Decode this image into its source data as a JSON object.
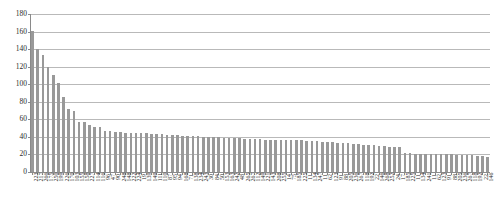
{
  "chart_data": {
    "type": "bar",
    "title": "",
    "xlabel": "",
    "ylabel": "",
    "ylim": [
      0,
      180
    ],
    "ytick_step": 20,
    "yticks": [
      180,
      160,
      140,
      120,
      100,
      80,
      60,
      40,
      20,
      0
    ],
    "grid": true,
    "legend": false,
    "bar_color": "#999999",
    "gridline_color": "#b9b9b9",
    "axis_color": "#8a8a8a",
    "categories": [
      "223",
      "217",
      "266",
      "175",
      "250",
      "199",
      "226",
      "170",
      "103",
      "155",
      "158",
      "227",
      "114",
      "116",
      "96",
      "47",
      "90",
      "248",
      "148",
      "222",
      "224",
      "19",
      "139",
      "149",
      "111",
      "110",
      "87",
      "95",
      "94",
      "168",
      "71",
      "138",
      "234",
      "243",
      "30",
      "84",
      "50",
      "153",
      "163",
      "242",
      "48",
      "265",
      "267",
      "112",
      "149",
      "221",
      "143",
      "208",
      "255",
      "14",
      "75",
      "185",
      "225",
      "11",
      "134",
      "247",
      "11",
      "62",
      "123",
      "91",
      "88",
      "205",
      "236",
      "267",
      "118",
      "192",
      "22",
      "146",
      "268",
      "252",
      "24",
      "17",
      "185",
      "225",
      "11",
      "134",
      "241",
      "11",
      "62",
      "123",
      "91",
      "88",
      "205",
      "236",
      "267",
      "118",
      "192",
      "22",
      "146"
    ],
    "values": [
      161,
      140,
      133,
      120,
      110,
      101,
      86,
      72,
      70,
      57,
      57,
      53,
      51,
      51,
      47,
      47,
      46,
      46,
      45,
      45,
      44,
      44,
      44,
      43,
      43,
      43,
      42,
      42,
      42,
      41,
      41,
      41,
      41,
      40,
      40,
      40,
      40,
      39,
      39,
      39,
      39,
      38,
      38,
      38,
      38,
      37,
      37,
      37,
      37,
      36,
      36,
      36,
      36,
      35,
      35,
      35,
      34,
      34,
      34,
      33,
      33,
      33,
      32,
      32,
      31,
      31,
      31,
      30,
      30,
      29,
      29,
      28,
      22,
      22,
      21,
      21,
      21,
      20,
      20,
      20,
      20,
      20,
      19,
      19,
      19,
      19,
      18,
      18,
      17
    ]
  }
}
